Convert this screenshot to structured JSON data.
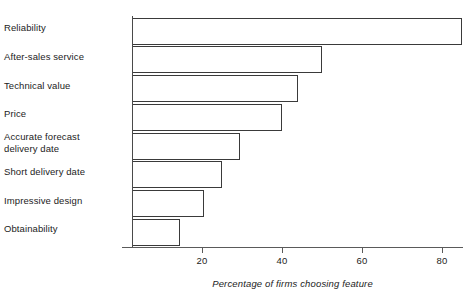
{
  "chart_data": {
    "type": "bar",
    "orientation": "horizontal",
    "title": "",
    "xlabel": "Percentage of firms choosing feature",
    "ylabel": "",
    "xlim": [
      0,
      88
    ],
    "xticks": [
      20,
      40,
      60,
      80
    ],
    "xtick_labels": [
      "20",
      "40",
      "60",
      "80"
    ],
    "grid": false,
    "legend": null,
    "bar_start_value": 2.5,
    "categories": [
      "Reliability",
      "After-sales service",
      "Technical value",
      "Price",
      "Accurate forecast\ndelivery date",
      "Short delivery date",
      "Impressive design",
      "Obtainability"
    ],
    "values": [
      85,
      50,
      44,
      40,
      29.5,
      25,
      20.5,
      14.5
    ],
    "bar_fill_color": "#ffffff",
    "bar_edge_color": "#3a3a3a",
    "axis_color": "#5a5a5a",
    "text_color": "#1c1c1c"
  }
}
